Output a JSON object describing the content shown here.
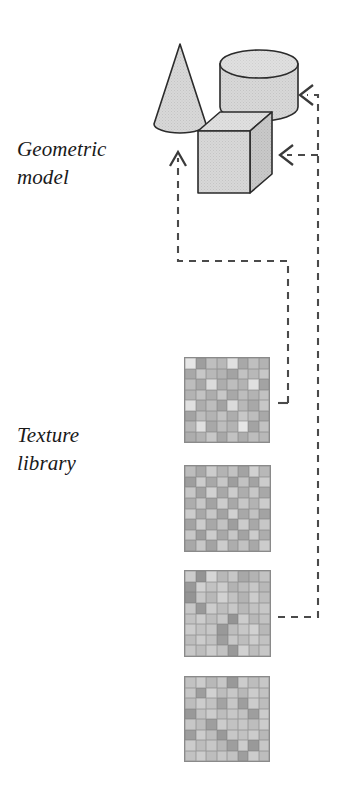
{
  "figure": {
    "width": 341,
    "height": 804,
    "background_color": "#ffffff"
  },
  "labels": {
    "geometric_model": "Geometric\nmodel",
    "texture_library": "Texture\nlibrary"
  },
  "colors": {
    "outline": "#2b2b2b",
    "shape_fill": "#d4d4d4",
    "shape_fill_light": "#dcdcdc",
    "shape_fill_dark": "#c2c2c2",
    "dash_line": "#4a4a4a",
    "tile_border": "#8a8a8a",
    "text": "#1a1a1a"
  },
  "shapes": [
    {
      "name": "cone",
      "type": "cone",
      "apex": [
        180,
        44
      ],
      "base_center": [
        180,
        127
      ],
      "base_radius_x": 26,
      "base_radius_y": 9,
      "fill": "#d8d8d8"
    },
    {
      "name": "cylinder",
      "type": "cylinder",
      "center_x": 259,
      "top_y": 64,
      "bottom_y": 107,
      "radius_x": 39,
      "radius_y": 14,
      "fill": "#d8d8d8"
    },
    {
      "name": "cube",
      "type": "cube",
      "front_left": 198,
      "front_top": 131,
      "front_width": 52,
      "front_height": 62,
      "depth_x": 22,
      "depth_y": -19,
      "fill_front": "#d2d2d2",
      "fill_top": "#dedede",
      "fill_right": "#c6c6c6"
    }
  ],
  "textures": [
    {
      "name": "texture-tile-1",
      "x": 184,
      "y": 357,
      "size": 86,
      "cols": 8,
      "rows": 8,
      "cells": [
        [
          90,
          62,
          75,
          72,
          88,
          66,
          75,
          70
        ],
        [
          66,
          78,
          72,
          70,
          64,
          76,
          72,
          78
        ],
        [
          74,
          66,
          86,
          68,
          74,
          70,
          88,
          64
        ],
        [
          70,
          76,
          68,
          78,
          66,
          74,
          70,
          76
        ],
        [
          88,
          68,
          74,
          64,
          86,
          72,
          66,
          78
        ],
        [
          64,
          74,
          70,
          76,
          68,
          78,
          74,
          66
        ],
        [
          72,
          88,
          66,
          74,
          70,
          90,
          64,
          76
        ],
        [
          68,
          70,
          78,
          66,
          76,
          68,
          74,
          72
        ]
      ]
    },
    {
      "name": "texture-tile-2",
      "x": 184,
      "y": 465,
      "size": 87,
      "cols": 8,
      "rows": 8,
      "cells": [
        [
          74,
          66,
          80,
          70,
          76,
          64,
          82,
          72
        ],
        [
          62,
          80,
          66,
          78,
          62,
          76,
          64,
          80
        ],
        [
          78,
          64,
          82,
          66,
          80,
          68,
          78,
          66
        ],
        [
          68,
          78,
          64,
          80,
          66,
          78,
          70,
          80
        ],
        [
          80,
          66,
          78,
          64,
          82,
          66,
          76,
          64
        ],
        [
          64,
          80,
          66,
          76,
          62,
          80,
          66,
          78
        ],
        [
          78,
          62,
          80,
          66,
          78,
          64,
          80,
          68
        ],
        [
          66,
          78,
          64,
          80,
          68,
          76,
          66,
          80
        ]
      ]
    },
    {
      "name": "texture-tile-3",
      "x": 184,
      "y": 570,
      "size": 87,
      "cols": 8,
      "rows": 8,
      "cells": [
        [
          80,
          58,
          84,
          72,
          78,
          66,
          70,
          76
        ],
        [
          60,
          82,
          76,
          80,
          70,
          74,
          78,
          72
        ],
        [
          58,
          78,
          72,
          82,
          76,
          70,
          80,
          74
        ],
        [
          78,
          60,
          80,
          74,
          78,
          72,
          76,
          78
        ],
        [
          76,
          80,
          74,
          78,
          58,
          80,
          72,
          76
        ],
        [
          80,
          76,
          78,
          60,
          74,
          78,
          82,
          72
        ],
        [
          74,
          80,
          76,
          62,
          78,
          74,
          80,
          76
        ],
        [
          78,
          74,
          80,
          76,
          60,
          82,
          74,
          78
        ]
      ]
    },
    {
      "name": "texture-tile-4",
      "x": 184,
      "y": 676,
      "size": 86,
      "cols": 8,
      "rows": 8,
      "cells": [
        [
          76,
          80,
          72,
          78,
          60,
          80,
          74,
          78
        ],
        [
          78,
          62,
          82,
          74,
          78,
          72,
          80,
          76
        ],
        [
          74,
          80,
          76,
          64,
          78,
          62,
          80,
          74
        ],
        [
          60,
          76,
          80,
          74,
          78,
          76,
          62,
          80
        ],
        [
          78,
          74,
          62,
          80,
          76,
          78,
          74,
          80
        ],
        [
          62,
          80,
          74,
          60,
          78,
          76,
          80,
          72
        ],
        [
          80,
          74,
          78,
          72,
          62,
          80,
          60,
          78
        ],
        [
          76,
          80,
          74,
          78,
          76,
          62,
          80,
          74
        ]
      ]
    }
  ],
  "connectors": [
    {
      "name": "texture-to-model-arrow",
      "description": "dashed path from texture library up into cube, arrowhead pointing up",
      "arrowhead": "up",
      "arrow_at": [
        178,
        152
      ]
    },
    {
      "name": "model-to-texture-arrow-upper",
      "description": "dashed path into cylinder from right, arrowhead pointing left",
      "arrowhead": "left",
      "arrow_at": [
        301,
        95
      ]
    },
    {
      "name": "model-to-texture-arrow-lower",
      "description": "dashed path into cube from right, arrowhead pointing left",
      "arrowhead": "left",
      "arrow_at": [
        281,
        155
      ]
    }
  ]
}
